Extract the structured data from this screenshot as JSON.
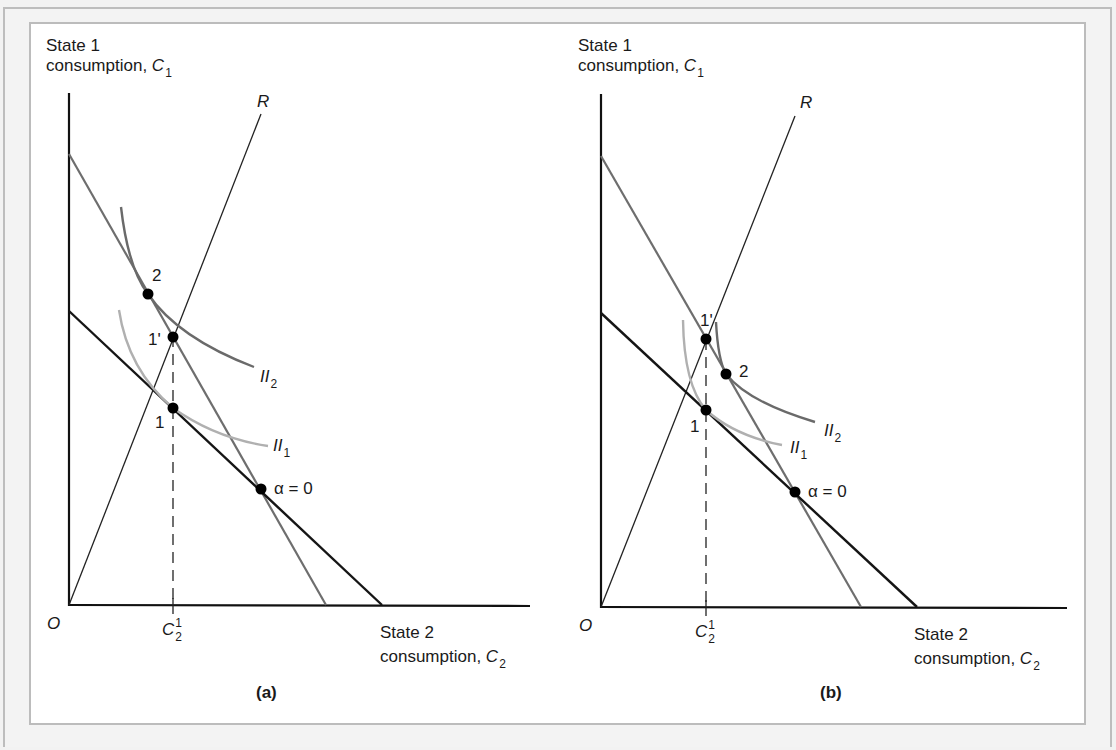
{
  "panels": [
    {
      "id": "a",
      "caption": "(a)",
      "y_axis_label": {
        "line1": "State 1",
        "line2": "consumption, ",
        "var": "C",
        "sub": "1"
      },
      "x_axis_label": {
        "line1": "State 2",
        "line2": "consumption, ",
        "var": "C",
        "sub": "2"
      },
      "origin_label": "O",
      "tick_label": {
        "var": "C",
        "sub": "2",
        "sup": "1"
      },
      "ray_label": "R",
      "points": [
        {
          "label": "2"
        },
        {
          "label": "1'"
        },
        {
          "label": "1"
        },
        {
          "label": "α = 0"
        }
      ],
      "curves": [
        {
          "var": "II",
          "sub": "2"
        },
        {
          "var": "II",
          "sub": "1"
        }
      ]
    },
    {
      "id": "b",
      "caption": "(b)",
      "y_axis_label": {
        "line1": "State 1",
        "line2": "consumption, ",
        "var": "C",
        "sub": "1"
      },
      "x_axis_label": {
        "line1": "State 2",
        "line2": "consumption, ",
        "var": "C",
        "sub": "2"
      },
      "origin_label": "O",
      "tick_label": {
        "var": "C",
        "sub": "2",
        "sup": "1"
      },
      "ray_label": "R",
      "points": [
        {
          "label": "1'"
        },
        {
          "label": "2"
        },
        {
          "label": "1"
        },
        {
          "label": "α = 0"
        }
      ],
      "curves": [
        {
          "var": "II",
          "sub": "2"
        },
        {
          "var": "II",
          "sub": "1"
        }
      ]
    }
  ],
  "colors": {
    "axis": "#111111",
    "budget_line": "#151515",
    "steep_line": "#6e6e6e",
    "ii2_curve": "#6a6a6a",
    "ii1_curve": "#b0b0b0",
    "ray": "#222222",
    "frame": "#bcbcbc"
  }
}
